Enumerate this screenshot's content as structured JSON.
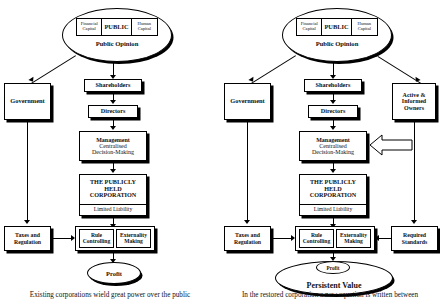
{
  "figure": {
    "panels": [
      {
        "id": "existing",
        "public_ellipse": {
          "center_label": "PUBLIC",
          "left_capital": {
            "line1": "Financial",
            "line2": "Capital"
          },
          "right_capital": {
            "line1": "Human",
            "line2": "Capital"
          },
          "opinion_label": "Public Opinion"
        },
        "government": "Government",
        "shareholders": "Shareholders",
        "directors": "Directors",
        "management": {
          "line1": "Management",
          "line2": "Centralised",
          "line3": "Decision-Making"
        },
        "corporation": {
          "line1": "THE PUBLICLY",
          "line2": "HELD",
          "line3": "CORPORATION",
          "footer": "Limited Liability"
        },
        "taxes": {
          "line1": "Taxes and",
          "line2": "Regulation"
        },
        "rule": {
          "line1": "Rule",
          "line2": "Controlling"
        },
        "externality": {
          "line1": "Externality",
          "line2": "Making"
        },
        "outcome_inner": "Profit",
        "outcome_outer": "",
        "caption": "Existing corporations wield great power over the public"
      },
      {
        "id": "restored",
        "public_ellipse": {
          "center_label": "PUBLIC",
          "left_capital": {
            "line1": "Financial",
            "line2": "Capital"
          },
          "right_capital": {
            "line1": "Human",
            "line2": "Capital"
          },
          "opinion_label": "Public Opinion"
        },
        "government": "Government",
        "shareholders": "Shareholders",
        "directors": "Directors",
        "management": {
          "line1": "Management",
          "line2": "Centralised",
          "line3": "Decision-Making"
        },
        "corporation": {
          "line1": "THE PUBLICLY",
          "line2": "HELD",
          "line3": "CORPORATION",
          "footer": "Limited Liability"
        },
        "taxes": {
          "line1": "Taxes and",
          "line2": "Regulation"
        },
        "rule": {
          "line1": "Rule",
          "line2": "Controlling"
        },
        "externality": {
          "line1": "Externality",
          "line2": "Making"
        },
        "owners": {
          "line1": "Active &",
          "line2": "Informed",
          "line3": "Owners"
        },
        "standards": {
          "line1": "Required",
          "line2": "Standards"
        },
        "outcome_inner": "Profit",
        "outcome_outer": "Persistent Value",
        "caption": "In the restored corporation a new equation is written between"
      }
    ]
  },
  "colors": {
    "ink": "#000000",
    "page": "#ffffff"
  }
}
